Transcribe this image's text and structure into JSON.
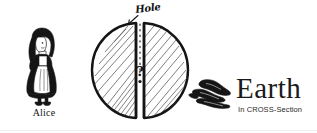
{
  "figure": {
    "title": "Earth",
    "subtitle": "In CROSS-Section",
    "background_color": "#ffffff",
    "ink_color": "#151515"
  },
  "labels": {
    "alice": "Alice",
    "hole": "Hole",
    "center_marker": "?"
  },
  "icons": {
    "alice": "alice-figure-icon",
    "earth_cross_section": "earth-cross-section-icon",
    "hole_pointer": "arrow-pointer-icon",
    "ink_object": "ink-blot-icon"
  },
  "diagram_data": {
    "type": "diagram",
    "description": "Hand-drawn cross-section of the Earth split into two hemispheres with a vertical hole passing through the center, Alice standing at the left, labelled Earth In CROSS-Section at the right.",
    "elements": [
      {
        "name": "alice",
        "label": "Alice"
      },
      {
        "name": "hole",
        "label": "Hole"
      },
      {
        "name": "earth-center",
        "label": "?"
      },
      {
        "name": "earth-title",
        "label": "Earth"
      },
      {
        "name": "earth-subtitle",
        "label": "In CROSS-Section"
      }
    ]
  }
}
